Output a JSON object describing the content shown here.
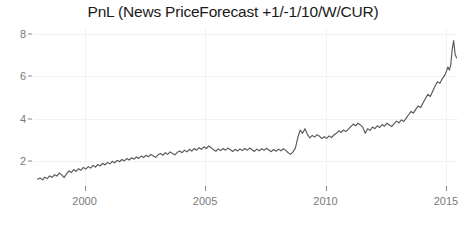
{
  "chart_data": {
    "type": "line",
    "title": "PnL (News PriceForecast +1/-1/10/W/CUR)",
    "xlabel": "",
    "ylabel": "",
    "grid": true,
    "legend": "none",
    "xlim": [
      1997.9,
      1115.5
    ],
    "xlim_years": [
      1997.9,
      2015.5
    ],
    "ylim": [
      0.8,
      8.3
    ],
    "yticks": [
      2,
      4,
      6,
      8
    ],
    "ytick_labels": [
      "2",
      "4",
      "6",
      "8"
    ],
    "xticks": [
      2000,
      2005,
      2010,
      2015
    ],
    "xtick_labels": [
      "2000",
      "2005",
      "2010",
      "2015"
    ],
    "line_color": "#595959",
    "grid_color": "#f2f2f2",
    "axis_text_color": "#7a7a7a",
    "title_color": "#1a1a1a",
    "background": "#ffffff",
    "series": [
      {
        "name": "PnL",
        "x": [
          1998.05,
          1998.15,
          1998.25,
          1998.35,
          1998.45,
          1998.55,
          1998.65,
          1998.75,
          1998.85,
          1998.95,
          1999.05,
          1999.15,
          1999.25,
          1999.35,
          1999.45,
          1999.55,
          1999.65,
          1999.75,
          1999.85,
          1999.95,
          2000.05,
          2000.15,
          2000.25,
          2000.35,
          2000.45,
          2000.55,
          2000.65,
          2000.75,
          2000.85,
          2000.95,
          2001.05,
          2001.15,
          2001.25,
          2001.35,
          2001.45,
          2001.55,
          2001.65,
          2001.75,
          2001.85,
          2001.95,
          2002.05,
          2002.15,
          2002.25,
          2002.35,
          2002.45,
          2002.55,
          2002.65,
          2002.75,
          2002.85,
          2002.95,
          2003.05,
          2003.15,
          2003.25,
          2003.35,
          2003.45,
          2003.55,
          2003.65,
          2003.75,
          2003.85,
          2003.95,
          2004.05,
          2004.15,
          2004.25,
          2004.35,
          2004.45,
          2004.55,
          2004.65,
          2004.75,
          2004.85,
          2004.95,
          2005.05,
          2005.15,
          2005.25,
          2005.35,
          2005.45,
          2005.55,
          2005.65,
          2005.75,
          2005.85,
          2005.95,
          2006.05,
          2006.15,
          2006.25,
          2006.35,
          2006.45,
          2006.55,
          2006.65,
          2006.75,
          2006.85,
          2006.95,
          2007.05,
          2007.15,
          2007.25,
          2007.35,
          2007.45,
          2007.55,
          2007.65,
          2007.75,
          2007.85,
          2007.95,
          2008.05,
          2008.15,
          2008.25,
          2008.35,
          2008.45,
          2008.55,
          2008.65,
          2008.75,
          2008.85,
          2008.95,
          2009.05,
          2009.15,
          2009.25,
          2009.35,
          2009.45,
          2009.55,
          2009.65,
          2009.75,
          2009.85,
          2009.95,
          2010.05,
          2010.15,
          2010.25,
          2010.35,
          2010.45,
          2010.55,
          2010.65,
          2010.75,
          2010.85,
          2010.95,
          2011.05,
          2011.15,
          2011.25,
          2011.35,
          2011.45,
          2011.55,
          2011.65,
          2011.75,
          2011.85,
          2011.95,
          2012.05,
          2012.15,
          2012.25,
          2012.35,
          2012.45,
          2012.55,
          2012.65,
          2012.75,
          2012.85,
          2012.95,
          2013.05,
          2013.15,
          2013.25,
          2013.35,
          2013.45,
          2013.55,
          2013.65,
          2013.75,
          2013.85,
          2013.95,
          2014.05,
          2014.15,
          2014.25,
          2014.35,
          2014.45,
          2014.55,
          2014.65,
          2014.75,
          2014.85,
          2014.95,
          2015.02,
          2015.08,
          2015.14,
          2015.2,
          2015.26,
          2015.32,
          2015.38,
          2015.44
        ],
        "y": [
          1.12,
          1.18,
          1.09,
          1.22,
          1.15,
          1.28,
          1.21,
          1.34,
          1.27,
          1.42,
          1.33,
          1.2,
          1.38,
          1.52,
          1.44,
          1.58,
          1.49,
          1.62,
          1.55,
          1.68,
          1.6,
          1.72,
          1.65,
          1.78,
          1.7,
          1.82,
          1.75,
          1.88,
          1.8,
          1.92,
          1.85,
          1.97,
          1.9,
          2.02,
          1.95,
          2.06,
          1.99,
          2.1,
          2.03,
          2.14,
          2.07,
          2.18,
          2.11,
          2.22,
          2.15,
          2.26,
          2.19,
          2.3,
          2.22,
          2.16,
          2.28,
          2.34,
          2.26,
          2.38,
          2.3,
          2.42,
          2.34,
          2.28,
          2.4,
          2.46,
          2.38,
          2.5,
          2.42,
          2.54,
          2.46,
          2.58,
          2.5,
          2.62,
          2.54,
          2.66,
          2.58,
          2.7,
          2.62,
          2.52,
          2.45,
          2.56,
          2.48,
          2.58,
          2.5,
          2.6,
          2.52,
          2.44,
          2.54,
          2.46,
          2.56,
          2.48,
          2.58,
          2.5,
          2.6,
          2.52,
          2.44,
          2.55,
          2.47,
          2.57,
          2.49,
          2.59,
          2.51,
          2.43,
          2.53,
          2.45,
          2.55,
          2.47,
          2.57,
          2.49,
          2.38,
          2.3,
          2.42,
          2.6,
          3.1,
          3.45,
          3.3,
          3.52,
          3.25,
          3.08,
          3.2,
          3.12,
          3.24,
          3.16,
          3.05,
          3.14,
          3.06,
          3.18,
          3.1,
          3.22,
          3.3,
          3.42,
          3.34,
          3.46,
          3.38,
          3.5,
          3.62,
          3.74,
          3.66,
          3.78,
          3.7,
          3.58,
          3.3,
          3.52,
          3.44,
          3.6,
          3.52,
          3.66,
          3.58,
          3.72,
          3.64,
          3.78,
          3.7,
          3.62,
          3.76,
          3.88,
          3.8,
          3.94,
          3.86,
          4.02,
          4.18,
          4.34,
          4.26,
          4.45,
          4.6,
          4.52,
          4.75,
          4.95,
          5.15,
          5.05,
          5.3,
          5.55,
          5.75,
          5.68,
          5.9,
          6.05,
          6.25,
          6.45,
          6.3,
          6.55,
          7.3,
          7.7,
          7.05,
          6.88
        ]
      }
    ]
  }
}
